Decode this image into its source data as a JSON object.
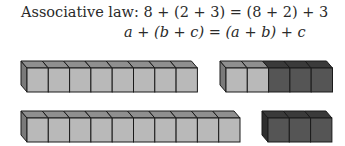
{
  "title_label": "Associative law:",
  "equations": {
    "numeric": "8 + (2 + 3) = (8 + 2) + 3",
    "algebraic": "a + (b + c) = (a + b) + c"
  },
  "colors": {
    "light_front": "#b9b9b9",
    "light_top": "#8f8f8f",
    "light_side": "#7a7a7a",
    "dark_front": "#555555",
    "dark_top": "#3a3a3a",
    "dark_side": "#2e2e2e",
    "edge": "#1a1a1a"
  },
  "rows": [
    {
      "label": "8 + (2 + 3)",
      "groups": [
        {
          "name": "eight",
          "light": 8,
          "dark": 0
        },
        {
          "name": "two-plus-three",
          "light": 2,
          "dark": 3
        }
      ]
    },
    {
      "label": "(8 + 2) + 3",
      "groups": [
        {
          "name": "eight-plus-two",
          "light": 10,
          "dark": 0
        },
        {
          "name": "three",
          "light": 0,
          "dark": 3
        }
      ]
    }
  ]
}
